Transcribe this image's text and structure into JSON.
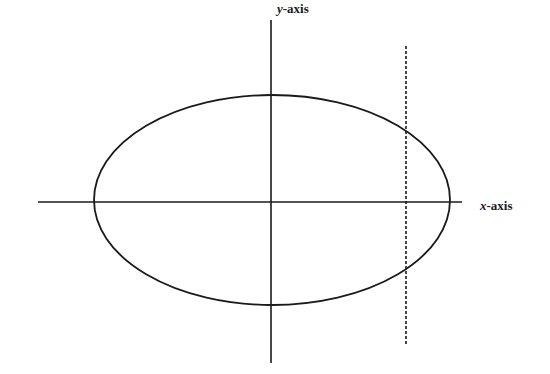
{
  "diagram": {
    "type": "ellipse-with-axes",
    "colors": {
      "stroke": "#1a1a1a",
      "background": "#ffffff"
    },
    "labels": {
      "y_axis_var": "y",
      "y_axis_suffix": "-axis",
      "x_axis_var": "x",
      "x_axis_suffix": "-axis"
    },
    "elements": {
      "x_axis": {
        "x1": 38,
        "y1": 202,
        "x2": 462,
        "y2": 202
      },
      "y_axis": {
        "x1": 271,
        "y1": 20,
        "x2": 271,
        "y2": 363
      },
      "ellipse": {
        "cx": 272,
        "cy": 200,
        "rx": 178,
        "ry": 105
      },
      "dashed_line": {
        "x1": 406,
        "y1": 46,
        "x2": 406,
        "y2": 345
      }
    }
  }
}
